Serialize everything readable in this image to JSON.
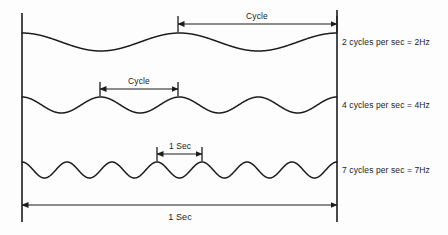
{
  "figure": {
    "background_color": "#fdfdfd",
    "line_color": "#1c1c1c",
    "text_color": "#1c1c1c"
  },
  "axes": {
    "left_rule": {
      "x": 22,
      "y_top": 13,
      "y_bottom": 222
    },
    "right_rule": {
      "x": 337,
      "y_top": 10,
      "y_bottom": 222
    }
  },
  "rows": [
    {
      "id": "row-2hz",
      "label": "2 cycles per sec = 2Hz",
      "cycles": 2,
      "baseline_y": 42,
      "amplitude": 9,
      "label_x": 342,
      "label_y": 37
    },
    {
      "id": "row-4hz",
      "label": "4 cycles per sec = 4Hz",
      "cycles": 4,
      "baseline_y": 105,
      "amplitude": 8,
      "label_x": 342,
      "label_y": 100
    },
    {
      "id": "row-7hz",
      "label": "7 cycles per sec = 7Hz",
      "cycles": 7,
      "baseline_y": 170,
      "amplitude": 8,
      "label_x": 342,
      "label_y": 165
    }
  ],
  "dimensions": [
    {
      "id": "dim-cycle-2hz",
      "label": "Cycle",
      "x_start": 178,
      "x_end": 337,
      "arrow_y": 24,
      "label_x": 257,
      "label_y": 11,
      "tick_top": 16,
      "tick_bottom": 32
    },
    {
      "id": "dim-cycle-4hz",
      "label": "Cycle",
      "x_start": 100,
      "x_end": 178,
      "arrow_y": 89,
      "label_x": 139,
      "label_y": 76,
      "tick_top": 82,
      "tick_bottom": 96
    },
    {
      "id": "dim-sec-7hz",
      "label": "1 Sec",
      "x_start": 157,
      "x_end": 202,
      "arrow_y": 154,
      "label_x": 180,
      "label_y": 141,
      "tick_top": 147,
      "tick_bottom": 161
    }
  ],
  "total_span": {
    "id": "dim-total-1sec",
    "label": "1 Sec",
    "x_start": 22,
    "x_end": 337,
    "arrow_y": 205,
    "label_x": 180,
    "label_y": 212
  },
  "chart_data": {
    "type": "line",
    "xlabel": "1 Sec",
    "ylabel": "",
    "x": [
      0,
      1
    ],
    "xlim": [
      0,
      1
    ],
    "grid": false,
    "legend": "right",
    "annotations": [
      "Cycle",
      "Cycle",
      "1 Sec",
      "1 Sec"
    ],
    "series": [
      {
        "name": "2 cycles per sec = 2Hz",
        "frequency_hz": 2,
        "cycles_per_second": 2,
        "amplitude": 9,
        "baseline_y": 42,
        "cycle_marker": {
          "label": "Cycle",
          "from": 0.5,
          "to": 1.0
        }
      },
      {
        "name": "4 cycles per sec = 4Hz",
        "frequency_hz": 4,
        "cycles_per_second": 4,
        "amplitude": 8,
        "baseline_y": 105,
        "cycle_marker": {
          "label": "Cycle",
          "from": 0.25,
          "to": 0.5
        }
      },
      {
        "name": "7 cycles per sec = 7Hz",
        "frequency_hz": 7,
        "cycles_per_second": 7,
        "amplitude": 8,
        "baseline_y": 170,
        "cycle_marker": {
          "label": "1 Sec",
          "from": 0.43,
          "to": 0.57
        }
      }
    ]
  }
}
